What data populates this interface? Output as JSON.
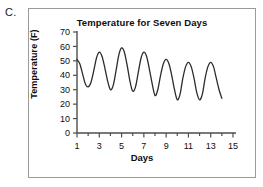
{
  "choice": {
    "label": "C."
  },
  "chart_data": {
    "type": "line",
    "title": "Temperature for Seven Days",
    "xlabel": "Days",
    "ylabel": "Temperature (F)",
    "xlim": [
      1,
      15
    ],
    "ylim": [
      0,
      70
    ],
    "grid": false,
    "legend": "none",
    "xticks": [
      1,
      3,
      5,
      7,
      9,
      11,
      13,
      15
    ],
    "yticks": [
      0,
      10,
      20,
      30,
      40,
      50,
      60,
      70
    ],
    "series": [
      {
        "name": "Temperature",
        "color": "#2b2b2b",
        "x": [
          1.0,
          1.25,
          1.5,
          1.75,
          2.0,
          2.25,
          2.5,
          2.75,
          3.0,
          3.25,
          3.5,
          3.75,
          4.0,
          4.25,
          4.5,
          4.75,
          5.0,
          5.25,
          5.5,
          5.75,
          6.0,
          6.25,
          6.5,
          6.75,
          7.0,
          7.25,
          7.5,
          7.75,
          8.0,
          8.25,
          8.5,
          8.75,
          9.0,
          9.25,
          9.5,
          9.75,
          10.0,
          10.25,
          10.5,
          10.75,
          11.0,
          11.25,
          11.5,
          11.75,
          12.0,
          12.25,
          12.5,
          12.75,
          13.0,
          13.25,
          13.5,
          13.75,
          14.0
        ],
        "y": [
          51,
          48,
          41,
          34,
          32,
          35,
          43,
          52,
          56,
          53,
          45,
          36,
          30,
          33,
          43,
          54,
          59,
          56,
          47,
          36,
          29,
          32,
          42,
          52,
          56,
          53,
          44,
          34,
          26,
          30,
          40,
          48,
          51,
          48,
          40,
          30,
          23,
          27,
          38,
          46,
          49,
          46,
          38,
          28,
          23,
          27,
          38,
          46,
          49,
          46,
          38,
          30,
          24
        ]
      }
    ]
  }
}
